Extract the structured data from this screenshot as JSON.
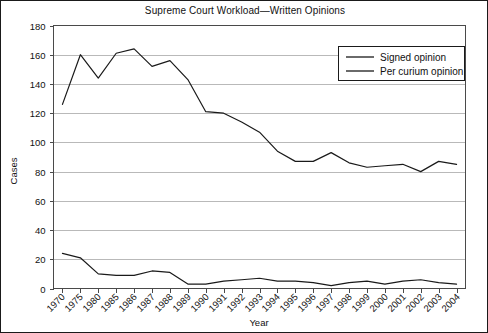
{
  "chart_data": {
    "type": "line",
    "title": "Supreme Court Workload—Written Opinions",
    "xlabel": "Year",
    "ylabel": "Cases",
    "ylim": [
      0,
      180
    ],
    "ytick_step": 20,
    "yticks": [
      "0",
      "20",
      "40",
      "60",
      "80",
      "100",
      "120",
      "140",
      "160",
      "180"
    ],
    "grid": true,
    "legend_position": "top-right",
    "categories": [
      "1970",
      "1975",
      "1980",
      "1985",
      "1986",
      "1987",
      "1988",
      "1989",
      "1990",
      "1991",
      "1992",
      "1993",
      "1994",
      "1995",
      "1996",
      "1997",
      "1998",
      "1999",
      "2000",
      "2001",
      "2002",
      "2003",
      "2004"
    ],
    "series": [
      {
        "name": "Signed opinion",
        "color": "#1a1a1a",
        "values": [
          126,
          160,
          144,
          161,
          164,
          152,
          156,
          143,
          121,
          120,
          114,
          107,
          94,
          87,
          87,
          93,
          86,
          83,
          84,
          85,
          80,
          87,
          85
        ]
      },
      {
        "name": "Per curium opinion",
        "color": "#1a1a1a",
        "values": [
          24,
          21,
          10,
          9,
          9,
          12,
          11,
          3,
          3,
          5,
          6,
          7,
          5,
          5,
          4,
          2,
          4,
          5,
          3,
          5,
          6,
          4,
          3
        ]
      }
    ]
  },
  "legend": {
    "entries": [
      {
        "label": "Signed opinion"
      },
      {
        "label": "Per curium opinion"
      }
    ]
  },
  "axes": {
    "y_title": "Cases",
    "x_title": "Year"
  }
}
